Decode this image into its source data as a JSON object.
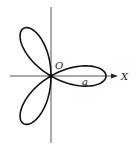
{
  "figure": {
    "curve": "r = a cos 3θ",
    "labels": {
      "origin": "O",
      "x_axis": "X",
      "parameter": "a"
    },
    "geometry": {
      "origin": [
        51,
        76
      ],
      "a_px": 55,
      "petals": 3,
      "x_axis": {
        "from": 10,
        "to": 118
      },
      "y_axis": {
        "from": 7,
        "to": 143
      }
    },
    "colors": {
      "curve": "#111111",
      "axis": "#555555",
      "background": "#ffffff"
    }
  }
}
